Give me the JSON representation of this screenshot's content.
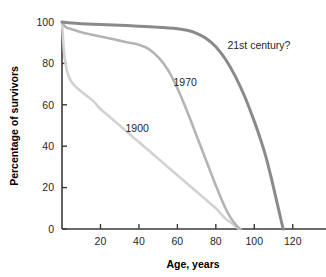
{
  "chart_data": {
    "type": "line",
    "title": "",
    "xlabel": "Age, years",
    "ylabel": "Percentage of survivors",
    "xlim": [
      0,
      130
    ],
    "ylim": [
      0,
      100
    ],
    "xticks": [
      20,
      40,
      60,
      80,
      100,
      120
    ],
    "yticks": [
      0,
      20,
      40,
      60,
      80,
      100
    ],
    "xtick_labels": [
      "20",
      "40",
      "60",
      "80",
      "100",
      "120"
    ],
    "ytick_labels": [
      "0",
      "20",
      "40",
      "60",
      "80",
      "100"
    ],
    "grid": false,
    "legend_position": "inline-annotations",
    "series": [
      {
        "name": "1900",
        "label": "1900",
        "color": "#d2d2d2",
        "annotation_x": 33,
        "annotation_y": 47,
        "x": [
          0,
          1,
          2,
          3,
          5,
          8,
          12,
          16,
          20,
          25,
          30,
          35,
          40,
          45,
          50,
          55,
          60,
          65,
          70,
          75,
          80,
          85,
          88,
          90,
          92
        ],
        "y": [
          100,
          86,
          79,
          75,
          71,
          68,
          65,
          62,
          58,
          54,
          50,
          46,
          42,
          38,
          34,
          30,
          26,
          22,
          18,
          14,
          10,
          5,
          3,
          1.5,
          0
        ]
      },
      {
        "name": "1970",
        "label": "1970",
        "color": "#b4b4b4",
        "annotation_x": 58,
        "annotation_y": 69,
        "x": [
          0,
          2,
          5,
          10,
          15,
          20,
          25,
          30,
          35,
          40,
          45,
          50,
          55,
          60,
          65,
          70,
          75,
          80,
          85,
          88,
          90,
          92,
          93
        ],
        "y": [
          100,
          97.5,
          96.5,
          95,
          94,
          93,
          92,
          91,
          90,
          89,
          87,
          83,
          77,
          68,
          57,
          45,
          33,
          21,
          10,
          5,
          2.5,
          0.5,
          0
        ]
      },
      {
        "name": "21st century?",
        "label": "21st century?",
        "color": "#8a8a8a",
        "annotation_x": 86,
        "annotation_y": 87,
        "x": [
          0,
          5,
          10,
          20,
          30,
          40,
          50,
          58,
          65,
          70,
          75,
          80,
          85,
          90,
          95,
          100,
          103,
          106,
          109,
          112,
          114,
          115
        ],
        "y": [
          100,
          99.5,
          99.2,
          98.8,
          98.4,
          98,
          97.5,
          97,
          96,
          94.5,
          92,
          88,
          82,
          74,
          64,
          52,
          44,
          35,
          24,
          12,
          4,
          0
        ]
      }
    ]
  },
  "axes": {
    "y_axis_title": "Percentage of survivors",
    "x_axis_title": "Age, years"
  }
}
